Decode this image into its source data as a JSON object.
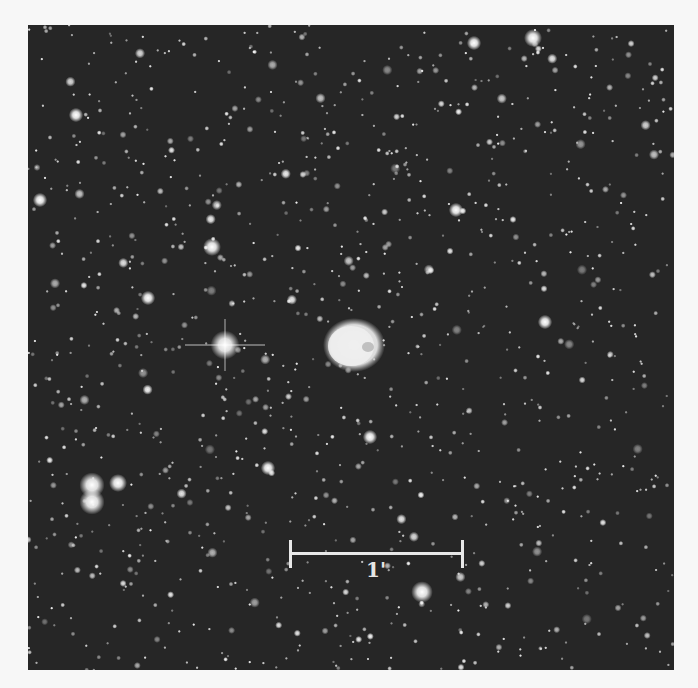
{
  "image": {
    "description": "Deep-sky star field with a bright planetary nebula at centre",
    "background": "#262626",
    "page_background": "#f7f7f7"
  },
  "scale_bar": {
    "label": "1'",
    "x1": 262,
    "x2": 434,
    "y": 528,
    "color": "#e8e8e8"
  },
  "nebula": {
    "cx": 326,
    "cy": 320,
    "rx": 27,
    "ry": 23
  },
  "bright_stars": [
    {
      "name": "diffraction-spike-star",
      "x": 197,
      "y": 320,
      "r": 8,
      "spikes": true
    },
    {
      "name": "double-star-top",
      "x": 64,
      "y": 460,
      "r": 7
    },
    {
      "name": "double-star-bottom",
      "x": 64,
      "y": 477,
      "r": 7
    },
    {
      "name": "star",
      "x": 90,
      "y": 458,
      "r": 5
    },
    {
      "name": "star",
      "x": 184,
      "y": 222,
      "r": 5
    },
    {
      "name": "star",
      "x": 394,
      "y": 567,
      "r": 6
    },
    {
      "name": "star",
      "x": 505,
      "y": 13,
      "r": 5
    },
    {
      "name": "star",
      "x": 446,
      "y": 18,
      "r": 4
    },
    {
      "name": "star",
      "x": 240,
      "y": 443,
      "r": 4
    },
    {
      "name": "star",
      "x": 12,
      "y": 175,
      "r": 4
    },
    {
      "name": "star",
      "x": 120,
      "y": 273,
      "r": 4
    },
    {
      "name": "star",
      "x": 517,
      "y": 297,
      "r": 4
    },
    {
      "name": "star",
      "x": 342,
      "y": 412,
      "r": 4
    },
    {
      "name": "star",
      "x": 48,
      "y": 90,
      "r": 4
    },
    {
      "name": "star",
      "x": 428,
      "y": 185,
      "r": 4
    }
  ],
  "field": {
    "seed": 1337,
    "count": 1100
  }
}
